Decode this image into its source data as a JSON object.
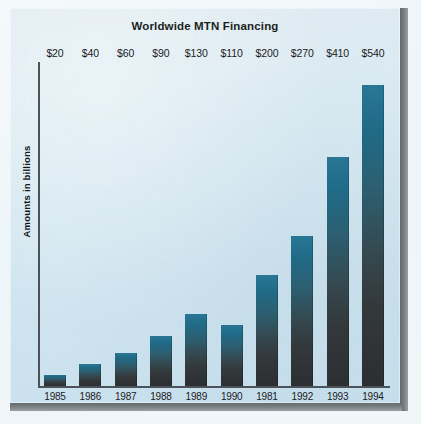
{
  "card": {
    "title": "Worldwide MTN Financing"
  },
  "chart_data": {
    "type": "bar",
    "title": "Worldwide MTN Financing",
    "xlabel": "",
    "ylabel": "Amounts in billions",
    "categories": [
      "1985",
      "1986",
      "1987",
      "1988",
      "1989",
      "1990",
      "1981",
      "1992",
      "1993",
      "1994"
    ],
    "values": [
      20,
      40,
      60,
      90,
      130,
      110,
      200,
      270,
      410,
      540
    ],
    "data_labels": [
      "$20",
      "$40",
      "$60",
      "$90",
      "$130",
      "$110",
      "$200",
      "$270",
      "$410",
      "$540"
    ],
    "ylim": [
      0,
      580
    ],
    "grid": false,
    "legend": null,
    "bar_gradient_top": "#2a7795",
    "bar_gradient_bottom": "#2c2f31",
    "plot_background": "#d6e8f1",
    "axis_color": "#4c5358",
    "text_color": "#1c2124"
  }
}
